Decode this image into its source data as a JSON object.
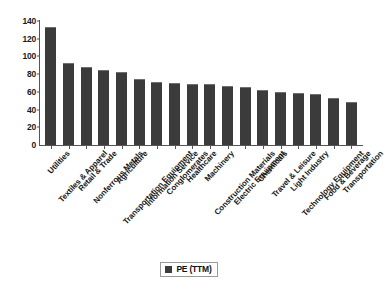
{
  "chart_data": {
    "type": "bar",
    "title": "",
    "subtitle": "",
    "xlabel": "",
    "ylabel": "",
    "ylim": [
      0,
      140
    ],
    "ytick_step": 20,
    "yticks": [
      140,
      120,
      100,
      80,
      60,
      40,
      20,
      0
    ],
    "grid": false,
    "legend_position": "bottom-center",
    "legend": [
      "PE (TTM)"
    ],
    "series_name": "PE (TTM)",
    "bar_color": "#3b3b3b",
    "categories": [
      "Utilities",
      "Textiles & Apparel",
      "Retail & Trade",
      "Nonferrous Metals",
      "Agriculture",
      "Transportation Equipment",
      "Information Service",
      "Conglomerates",
      "Healthcare",
      "Machinery",
      "Construction Materials",
      "Electric Equipment",
      "Chemicals",
      "Travel & Leisure",
      "Light Industry",
      "Technology Equipment",
      "Food & Beverage",
      "Transportation"
    ],
    "values": [
      133,
      93,
      88,
      85,
      82,
      75,
      71,
      70,
      69,
      69,
      67,
      65,
      62,
      60,
      59,
      58,
      53,
      49
    ]
  },
  "legend": {
    "swatch_name": "pe-ttm-swatch",
    "label": "PE (TTM)"
  }
}
